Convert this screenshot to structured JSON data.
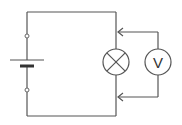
{
  "diagram": {
    "type": "circuit-schematic",
    "components": [
      {
        "id": "battery",
        "kind": "cell",
        "terminals": 2
      },
      {
        "id": "lamp",
        "kind": "lamp",
        "symbol": "circle-with-cross"
      },
      {
        "id": "voltmeter",
        "kind": "voltmeter",
        "symbol_label": "V",
        "connection": "parallel to lamp"
      }
    ],
    "colors": {
      "wire": "#555555",
      "background": "#ffffff"
    }
  }
}
